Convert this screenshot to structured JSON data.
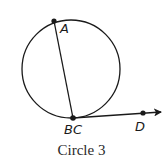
{
  "figure": {
    "caption": "Circle 3",
    "circle": {
      "cx": 71,
      "cy": 69,
      "r": 50
    },
    "points": {
      "A": {
        "label": "A",
        "x": 54,
        "y": 21
      },
      "BC": {
        "label": "BC",
        "x": 73,
        "y": 118
      },
      "D": {
        "label": "D",
        "x": 143,
        "y": 113
      }
    },
    "segments": [
      {
        "name": "chord-AB",
        "from": "A",
        "to": "BC"
      }
    ],
    "rays": [
      {
        "name": "ray-CD",
        "from": "BC",
        "through": "D"
      }
    ],
    "colors": {
      "stroke": "#1a1a1a",
      "background": "#ffffff"
    }
  }
}
